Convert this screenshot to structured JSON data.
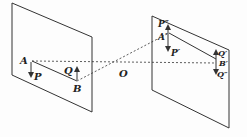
{
  "diagram": {
    "labels": {
      "A": "A",
      "P": "P",
      "Q": "Q",
      "B": "B",
      "O": "O",
      "P2": "P″",
      "A2": "A′",
      "P1": "P′",
      "Q1": "Q′",
      "B2": "B′",
      "Q2": "Q″"
    },
    "colors": {
      "line": "#333333",
      "background": "#fdfdfd"
    }
  }
}
